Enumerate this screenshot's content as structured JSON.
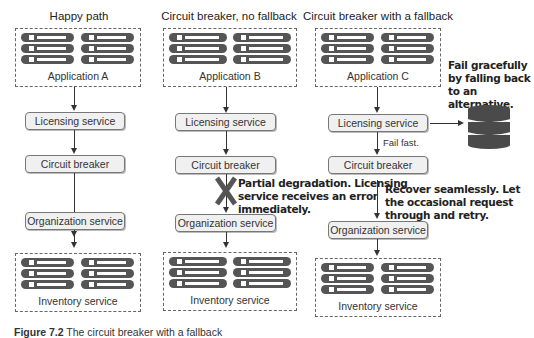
{
  "columns": [
    {
      "title": "Happy path",
      "top_box_label": "Application A",
      "services": [
        "Licensing service",
        "Circuit breaker",
        "Organization service"
      ],
      "bottom_box_label": "Inventory service"
    },
    {
      "title": "Circuit breaker, no fallback",
      "top_box_label": "Application B",
      "services": [
        "Licensing service",
        "Circuit breaker",
        "Organization service"
      ],
      "bottom_box_label": "Inventory service",
      "callout": "Partial degradation. Licensing service receives an error immediately.",
      "callout_lines": [
        "Partial degradation. Licensing",
        "service receives an error",
        "immediately."
      ],
      "blocked_icon": "x-mark-icon"
    },
    {
      "title": "Circuit breaker with a fallback",
      "top_box_label": "Application C",
      "services": [
        "Licensing service",
        "Circuit breaker",
        "Organization service"
      ],
      "bottom_box_label": "Inventory service",
      "fail_fast_label": "Fail fast.",
      "fallback_callout_lines": [
        "Fail gracefully",
        "by falling back",
        "to an alternative."
      ],
      "recover_callout_lines": [
        "Recover seamlessly. Let",
        "the occasional request",
        "through and retry."
      ],
      "fallback_icon": "database-icon"
    }
  ],
  "caption": {
    "label": "Figure 7.2",
    "text": "The circuit breaker with a fallback"
  },
  "colors": {
    "rack": "#555555",
    "service_fill": "#f0f0f0",
    "service_border": "#777777",
    "database": "#4a4a4a"
  }
}
